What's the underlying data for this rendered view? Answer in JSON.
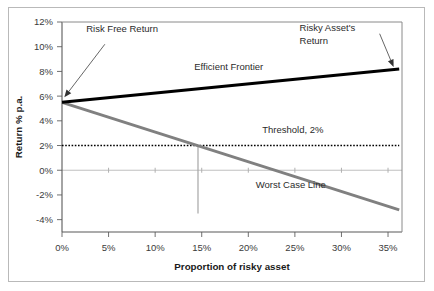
{
  "chart_data": {
    "type": "line",
    "title": "",
    "xlabel": "Proportion of risky asset",
    "ylabel": "Return % p.a.",
    "xlim": [
      0,
      36.5
    ],
    "ylim": [
      -5.0,
      12.0
    ],
    "xticks": [
      "0%",
      "5%",
      "10%",
      "15%",
      "20%",
      "25%",
      "30%",
      "35%"
    ],
    "xtick_values": [
      0,
      5,
      10,
      15,
      20,
      25,
      30,
      35
    ],
    "yticks": [
      "-4%",
      "-2%",
      "0%",
      "2%",
      "4%",
      "6%",
      "8%",
      "10%",
      "12%"
    ],
    "ytick_values": [
      -4,
      -2,
      0,
      2,
      4,
      6,
      8,
      10,
      12
    ],
    "grid": false,
    "legend_position": "none",
    "series": [
      {
        "name": "Efficient Frontier",
        "style": "solid-thick-black",
        "color": "#000000",
        "x": [
          0,
          36.2
        ],
        "y": [
          5.5,
          8.2
        ]
      },
      {
        "name": "Worst Case Line",
        "style": "solid-thick-gray",
        "color": "#808080",
        "x": [
          0,
          36.2
        ],
        "y": [
          5.5,
          -3.2
        ]
      },
      {
        "name": "Threshold, 2%",
        "style": "dotted-black",
        "color": "#000000",
        "x": [
          0,
          36.2
        ],
        "y": [
          2,
          2
        ]
      }
    ],
    "markers": [
      {
        "name": "break-even-vertical",
        "color": "#a6a6a6",
        "x": 14.6,
        "y_from": 2.0,
        "y_to": -3.5
      },
      {
        "name": "zero-gridline",
        "color": "#bfbfbf",
        "y": 0
      }
    ],
    "annotations": [
      {
        "name": "risk-free-return",
        "text": "Risk Free Return",
        "text_x": 2.6,
        "text_y": 11.2,
        "arrow_to_x": 0.25,
        "arrow_to_y": 5.9
      },
      {
        "name": "risky-assets-return",
        "text_line1": "Risky Asset's",
        "text_line2": "Return",
        "text_x": 25.5,
        "text_y": 11.3,
        "arrow_to_x": 35.6,
        "arrow_to_y": 8.35
      },
      {
        "name": "efficient-frontier-label",
        "text": "Efficient Frontier",
        "text_x": 14.2,
        "text_y": 8.15
      },
      {
        "name": "threshold-label",
        "text": "Threshold, 2%",
        "text_x": 21.5,
        "text_y": 3.0
      },
      {
        "name": "worst-case-line-label",
        "text": "Worst Case Line",
        "text_x": 20.8,
        "text_y": -1.45
      }
    ]
  }
}
